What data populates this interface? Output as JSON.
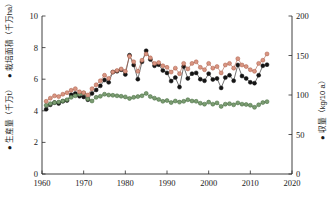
{
  "chart_data": {
    "type": "line",
    "title": "",
    "subtitle": "",
    "xlabel": "",
    "ylabel": "",
    "grid": false,
    "legend_position": "axis-labels",
    "xlim": [
      1960,
      2020
    ],
    "xticks": [
      1960,
      1970,
      1980,
      1990,
      2000,
      2010,
      2020
    ],
    "left_axis": {
      "label_production": "● 生産量（千万t）",
      "label_area": "● 栽培面積（千万ha）",
      "ylim": [
        0,
        10
      ],
      "yticks": [
        0,
        2,
        4,
        6,
        8,
        10
      ]
    },
    "right_axis": {
      "label_yield": "● 収量（kg/10 a）",
      "ylim": [
        0,
        200
      ],
      "yticks": [
        0,
        50,
        100,
        150,
        200
      ]
    },
    "x": [
      1961,
      1962,
      1963,
      1964,
      1965,
      1966,
      1967,
      1968,
      1969,
      1970,
      1971,
      1972,
      1973,
      1974,
      1975,
      1976,
      1977,
      1978,
      1979,
      1980,
      1981,
      1982,
      1983,
      1984,
      1985,
      1986,
      1987,
      1988,
      1989,
      1990,
      1991,
      1992,
      1993,
      1994,
      1995,
      1996,
      1997,
      1998,
      1999,
      2000,
      2001,
      2002,
      2003,
      2004,
      2005,
      2006,
      2007,
      2008,
      2009,
      2010,
      2011,
      2012,
      2013,
      2014
    ],
    "series": [
      {
        "name": "生産量（千万t）",
        "marker": "circle-filled",
        "color": "#141414",
        "edge_color": "#141414",
        "axis": "left",
        "values": [
          4.1,
          4.38,
          4.52,
          4.46,
          4.6,
          4.65,
          5.02,
          5.1,
          4.92,
          4.88,
          4.7,
          5.1,
          5.32,
          5.58,
          5.95,
          5.8,
          6.45,
          6.5,
          6.6,
          6.3,
          7.52,
          6.9,
          6.0,
          7.1,
          7.8,
          7.25,
          6.85,
          6.92,
          6.55,
          6.4,
          5.88,
          6.1,
          5.5,
          6.8,
          6.05,
          6.35,
          6.4,
          6.0,
          5.9,
          6.35,
          5.98,
          6.05,
          5.45,
          6.1,
          6.25,
          5.9,
          6.9,
          6.2,
          6.05,
          5.8,
          5.75,
          6.25,
          6.85,
          6.92
        ]
      },
      {
        "name": "栽培面積（千万ha）",
        "marker": "circle-filled",
        "color": "#7b9c72",
        "edge_color": "#3f6638",
        "axis": "left",
        "values": [
          4.35,
          4.45,
          4.52,
          4.55,
          4.62,
          4.7,
          4.85,
          4.95,
          5.05,
          5.12,
          4.75,
          4.62,
          4.85,
          4.92,
          5.05,
          5.0,
          4.98,
          4.95,
          4.92,
          4.88,
          4.78,
          4.85,
          4.9,
          4.95,
          5.1,
          4.9,
          4.8,
          4.72,
          4.6,
          4.65,
          4.52,
          4.62,
          4.55,
          4.6,
          4.7,
          4.62,
          4.6,
          4.48,
          4.42,
          4.55,
          4.42,
          4.5,
          4.28,
          4.42,
          4.45,
          4.38,
          4.5,
          4.42,
          4.4,
          4.35,
          4.22,
          4.38,
          4.52,
          4.58
        ]
      },
      {
        "name": "収量（kg/10 a）",
        "marker": "circle-filled",
        "color": "#d99582",
        "edge_color": "#a85a44",
        "axis": "right",
        "values": [
          92,
          96,
          99,
          98,
          101,
          103,
          106,
          108,
          104,
          103,
          100,
          108,
          113,
          118,
          125,
          121,
          129,
          131,
          133,
          130,
          149,
          142,
          130,
          144,
          152,
          147,
          140,
          141,
          137,
          135,
          129,
          134,
          127,
          140,
          133,
          140,
          142,
          135,
          132,
          140,
          134,
          136,
          128,
          138,
          140,
          134,
          146,
          138,
          136,
          132,
          130,
          140,
          144,
          152
        ]
      }
    ]
  },
  "plot_geometry": {
    "left": 42,
    "right": 292,
    "top": 16,
    "bottom": 174
  },
  "axis_labels": {
    "x_tick_1": "1960",
    "x_tick_2": "1970",
    "x_tick_3": "1980",
    "x_tick_4": "1990",
    "x_tick_5": "2000",
    "x_tick_6": "2010",
    "x_tick_7": "2020",
    "y_left_0": "0",
    "y_left_1": "2",
    "y_left_2": "4",
    "y_left_3": "6",
    "y_left_4": "8",
    "y_left_5": "10",
    "y_right_0": "0",
    "y_right_1": "50",
    "y_right_2": "100",
    "y_right_3": "150",
    "y_right_4": "200"
  }
}
